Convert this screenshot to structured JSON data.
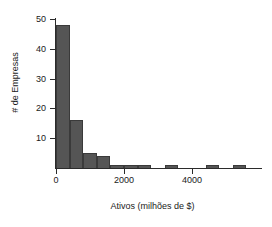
{
  "chart_data": {
    "type": "bar",
    "title": "",
    "subtitle": "",
    "xlabel": "Ativos (milhões de $)",
    "ylabel": "# de Empresas",
    "xlim": [
      0,
      6000
    ],
    "ylim": [
      0,
      52
    ],
    "grid": false,
    "legend": null,
    "bar_color": "#555555",
    "bar_edge_color": "#3a3a3a",
    "axis_color": "#2b2b2b",
    "bin_width": 400,
    "x_tick_labels": [
      "0",
      "2000",
      "4000"
    ],
    "x_tick_values": [
      0,
      2000,
      4000
    ],
    "y_tick_labels": [
      "10",
      "20",
      "30",
      "40",
      "50"
    ],
    "y_tick_values": [
      10,
      20,
      30,
      40,
      50
    ],
    "bins": [
      {
        "start": 0,
        "end": 400,
        "count": 48
      },
      {
        "start": 400,
        "end": 800,
        "count": 16
      },
      {
        "start": 800,
        "end": 1200,
        "count": 5
      },
      {
        "start": 1200,
        "end": 1600,
        "count": 4
      },
      {
        "start": 1600,
        "end": 2000,
        "count": 1
      },
      {
        "start": 2000,
        "end": 2400,
        "count": 1
      },
      {
        "start": 2400,
        "end": 2800,
        "count": 1
      },
      {
        "start": 3200,
        "end": 3600,
        "count": 1
      },
      {
        "start": 4400,
        "end": 4800,
        "count": 1
      },
      {
        "start": 5200,
        "end": 5600,
        "count": 1
      }
    ],
    "categories": [
      "0-400",
      "400-800",
      "800-1200",
      "1200-1600",
      "1600-2000",
      "2000-2400",
      "2400-2800",
      "3200-3600",
      "4400-4800",
      "5200-5600"
    ],
    "values": [
      48,
      16,
      5,
      4,
      1,
      1,
      1,
      1,
      1,
      1
    ]
  }
}
